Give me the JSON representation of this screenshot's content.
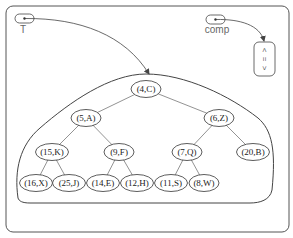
{
  "variables": {
    "tree_var": {
      "label": "T"
    },
    "comp_var": {
      "label": "comp"
    }
  },
  "comparator": {
    "symbols": [
      "<",
      "=",
      ">"
    ]
  },
  "tree": {
    "nodes": [
      {
        "id": "n0",
        "label": "(4,C)",
        "x": 146,
        "y": 89
      },
      {
        "id": "n1",
        "label": "(5,A)",
        "x": 86,
        "y": 118
      },
      {
        "id": "n2",
        "label": "(6,Z)",
        "x": 219,
        "y": 118
      },
      {
        "id": "n3",
        "label": "(15,K)",
        "x": 52,
        "y": 152
      },
      {
        "id": "n4",
        "label": "(9,F)",
        "x": 119,
        "y": 152
      },
      {
        "id": "n5",
        "label": "(7,Q)",
        "x": 187,
        "y": 152
      },
      {
        "id": "n6",
        "label": "(20,B)",
        "x": 253,
        "y": 152
      },
      {
        "id": "n7",
        "label": "(16,X)",
        "x": 36,
        "y": 183
      },
      {
        "id": "n8",
        "label": "(25,J)",
        "x": 69,
        "y": 183
      },
      {
        "id": "n9",
        "label": "(14,E)",
        "x": 103,
        "y": 183
      },
      {
        "id": "n10",
        "label": "(12,H)",
        "x": 137,
        "y": 183
      },
      {
        "id": "n11",
        "label": "(11,S)",
        "x": 171,
        "y": 183
      },
      {
        "id": "n12",
        "label": "(8,W)",
        "x": 204,
        "y": 183
      }
    ],
    "edges": [
      [
        "n0",
        "n1"
      ],
      [
        "n0",
        "n2"
      ],
      [
        "n1",
        "n3"
      ],
      [
        "n1",
        "n4"
      ],
      [
        "n2",
        "n5"
      ],
      [
        "n2",
        "n6"
      ],
      [
        "n3",
        "n7"
      ],
      [
        "n3",
        "n8"
      ],
      [
        "n4",
        "n9"
      ],
      [
        "n4",
        "n10"
      ],
      [
        "n5",
        "n11"
      ],
      [
        "n5",
        "n12"
      ]
    ]
  }
}
